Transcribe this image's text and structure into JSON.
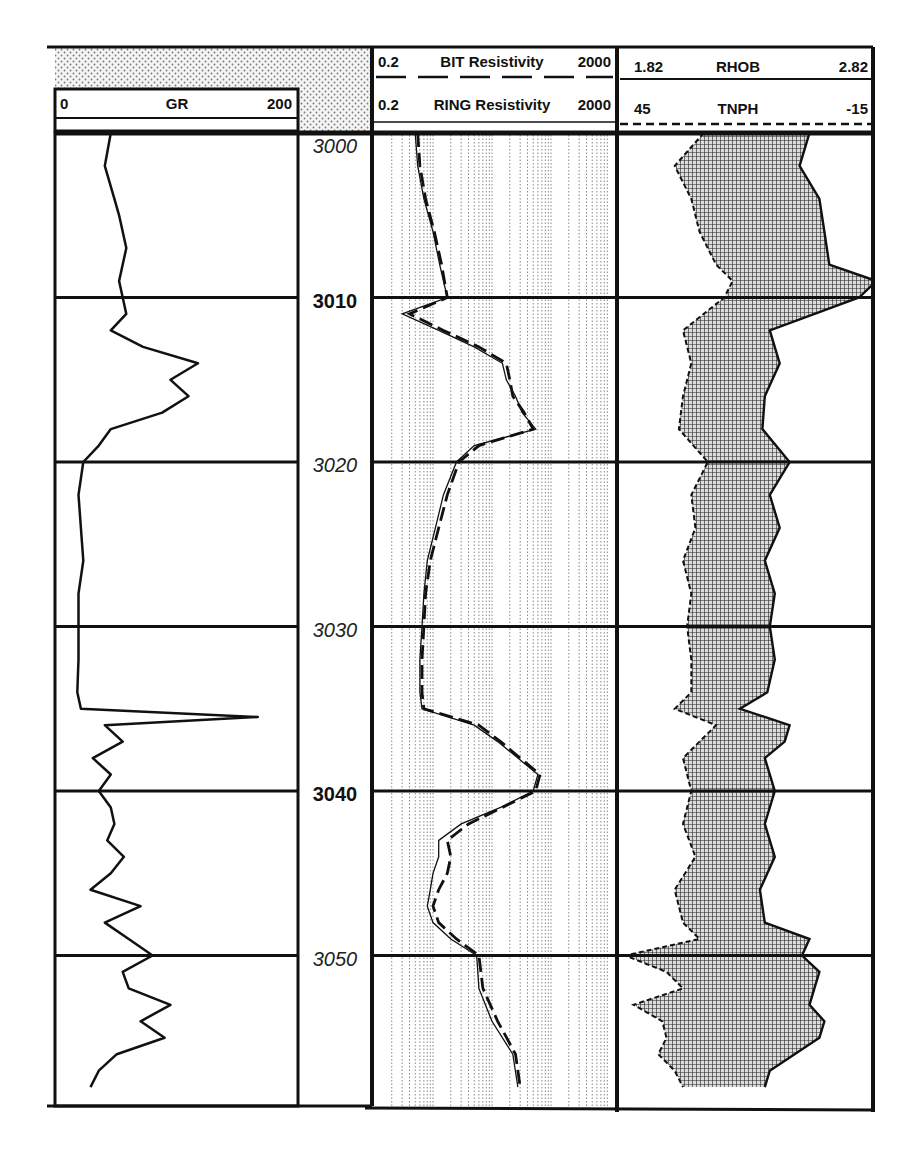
{
  "chart_data": {
    "type": "line",
    "depth_axis": {
      "label": "Depth",
      "range": [
        3000,
        3058
      ],
      "ticks": [
        3000,
        3010,
        3020,
        3030,
        3040,
        3050
      ],
      "bold_ticks": [
        3010,
        3040
      ],
      "grid": true
    },
    "tracks": [
      {
        "name": "GR track",
        "curves": [
          {
            "name": "GR",
            "min": 0,
            "max": 200,
            "scale": "linear",
            "line": "solid",
            "depth": [
              3000,
              3002,
              3004,
              3005,
              3007,
              3008,
              3009,
              3010,
              3011,
              3012,
              3013,
              3014,
              3015,
              3016,
              3017,
              3018,
              3019,
              3020,
              3022,
              3024,
              3026,
              3028,
              3030,
              3032,
              3034,
              3035,
              3035.5,
              3036,
              3037,
              3038,
              3039,
              3040,
              3041,
              3042,
              3043,
              3044,
              3045,
              3046,
              3047,
              3048,
              3049,
              3050,
              3051,
              3052,
              3053,
              3054,
              3055,
              3056,
              3057,
              3058
            ],
            "values": [
              45,
              40,
              48,
              52,
              58,
              55,
              52,
              55,
              58,
              45,
              72,
              118,
              95,
              110,
              88,
              45,
              35,
              22,
              18,
              20,
              22,
              18,
              18,
              18,
              17,
              20,
              168,
              40,
              55,
              30,
              45,
              35,
              45,
              48,
              42,
              56,
              45,
              28,
              70,
              40,
              60,
              80,
              55,
              60,
              95,
              70,
              90,
              50,
              35,
              28
            ]
          }
        ]
      },
      {
        "name": "Resistivity track",
        "curves": [
          {
            "name": "BIT Resistivity",
            "min": 0.2,
            "max": 2000,
            "scale": "log",
            "line": "dashed",
            "depth": [
              3000,
              3002,
              3004,
              3006,
              3008,
              3010,
              3011,
              3012,
              3013,
              3014,
              3015,
              3016,
              3017,
              3018,
              3019,
              3020,
              3022,
              3024,
              3026,
              3028,
              3030,
              3032,
              3034,
              3035,
              3036,
              3037,
              3038,
              3039,
              3040,
              3041,
              3042,
              3043,
              3044,
              3045,
              3046,
              3047,
              3048,
              3049,
              3050,
              3052,
              3054,
              3056,
              3058
            ],
            "values": [
              1.1,
              1.2,
              1.5,
              2.1,
              2.8,
              3.5,
              0.8,
              3.0,
              12,
              35,
              40,
              45,
              70,
              100,
              12,
              5.5,
              3.5,
              2.5,
              1.8,
              1.5,
              1.4,
              1.3,
              1.3,
              1.4,
              12,
              28,
              60,
              130,
              110,
              30,
              8,
              3.5,
              4,
              3.5,
              2.5,
              2.0,
              2.5,
              5,
              12,
              14,
              25,
              50,
              60
            ]
          },
          {
            "name": "RING Resistivity",
            "min": 0.2,
            "max": 2000,
            "scale": "log",
            "line": "solid",
            "depth": [
              3000,
              3002,
              3004,
              3006,
              3008,
              3010,
              3011,
              3012,
              3013,
              3014,
              3015,
              3016,
              3017,
              3018,
              3019,
              3020,
              3022,
              3024,
              3026,
              3028,
              3030,
              3032,
              3034,
              3035,
              3036,
              3037,
              3038,
              3039,
              3040,
              3041,
              3042,
              3043,
              3044,
              3045,
              3046,
              3047,
              3048,
              3049,
              3050,
              3052,
              3054,
              3056,
              3058
            ],
            "values": [
              1.0,
              1.1,
              1.4,
              2.0,
              2.6,
              3.5,
              0.6,
              2.5,
              10,
              30,
              35,
              50,
              65,
              110,
              10,
              5,
              3,
              2.2,
              1.6,
              1.4,
              1.3,
              1.2,
              1.2,
              1.3,
              10,
              25,
              55,
              120,
              100,
              28,
              6,
              2.5,
              2.5,
              2,
              1.8,
              1.6,
              2,
              4,
              11,
              12,
              20,
              45,
              55
            ]
          }
        ]
      },
      {
        "name": "Density-Neutron track",
        "curves": [
          {
            "name": "RHOB",
            "min": 1.82,
            "max": 2.82,
            "scale": "linear",
            "line": "solid",
            "depth": [
              3000,
              3002,
              3004,
              3006,
              3008,
              3009,
              3010,
              3012,
              3014,
              3016,
              3018,
              3020,
              3022,
              3024,
              3026,
              3028,
              3030,
              3032,
              3034,
              3035,
              3036,
              3037,
              3038,
              3040,
              3042,
              3044,
              3046,
              3048,
              3049,
              3050,
              3051,
              3052,
              3053,
              3054,
              3055,
              3056,
              3057,
              3058
            ],
            "values": [
              2.58,
              2.54,
              2.62,
              2.64,
              2.66,
              2.85,
              2.78,
              2.42,
              2.46,
              2.4,
              2.39,
              2.5,
              2.42,
              2.46,
              2.4,
              2.44,
              2.42,
              2.44,
              2.41,
              2.3,
              2.5,
              2.48,
              2.4,
              2.44,
              2.4,
              2.44,
              2.38,
              2.4,
              2.58,
              2.55,
              2.62,
              2.6,
              2.58,
              2.64,
              2.62,
              2.52,
              2.42,
              2.4
            ]
          },
          {
            "name": "TNPH",
            "min": 45,
            "max": -15,
            "scale": "linear",
            "line": "dashed",
            "depth": [
              3000,
              3002,
              3004,
              3006,
              3008,
              3009,
              3010,
              3012,
              3014,
              3016,
              3018,
              3020,
              3022,
              3024,
              3026,
              3028,
              3030,
              3032,
              3034,
              3035,
              3036,
              3037,
              3038,
              3040,
              3042,
              3044,
              3046,
              3048,
              3049,
              3050,
              3051,
              3052,
              3053,
              3054,
              3055,
              3056,
              3057,
              3058
            ],
            "values": [
              25,
              32,
              28,
              26,
              22,
              18,
              20,
              30,
              28,
              30,
              31,
              24,
              28,
              27,
              30,
              28,
              29,
              28,
              28,
              32,
              22,
              26,
              30,
              28,
              30,
              27,
              32,
              30,
              26,
              44,
              34,
              30,
              42,
              35,
              34,
              36,
              32,
              30
            ]
          }
        ],
        "fill": {
          "between": [
            "RHOB",
            "TNPH"
          ],
          "pattern": "crosshatch",
          "color": "#333333"
        }
      }
    ],
    "headers": {
      "gr": {
        "left": "0",
        "name": "GR",
        "right": "200"
      },
      "bit": {
        "left": "0.2",
        "name": "BIT Resistivity",
        "right": "2000"
      },
      "ring": {
        "left": "0.2",
        "name": "RING Resistivity",
        "right": "2000"
      },
      "rhob": {
        "left": "1.82",
        "name": "RHOB",
        "right": "2.82"
      },
      "tnph": {
        "left": "45",
        "name": "TNPH",
        "right": "-15"
      }
    },
    "depth_labels": [
      {
        "text": "3000",
        "style": "italic"
      },
      {
        "text": "3010",
        "style": "bold"
      },
      {
        "text": "3020",
        "style": "italic"
      },
      {
        "text": "3030",
        "style": "italic"
      },
      {
        "text": "3040",
        "style": "bold"
      },
      {
        "text": "3050",
        "style": "italic"
      }
    ],
    "layout": {
      "legend_position": "top-headers",
      "grid": true
    }
  }
}
